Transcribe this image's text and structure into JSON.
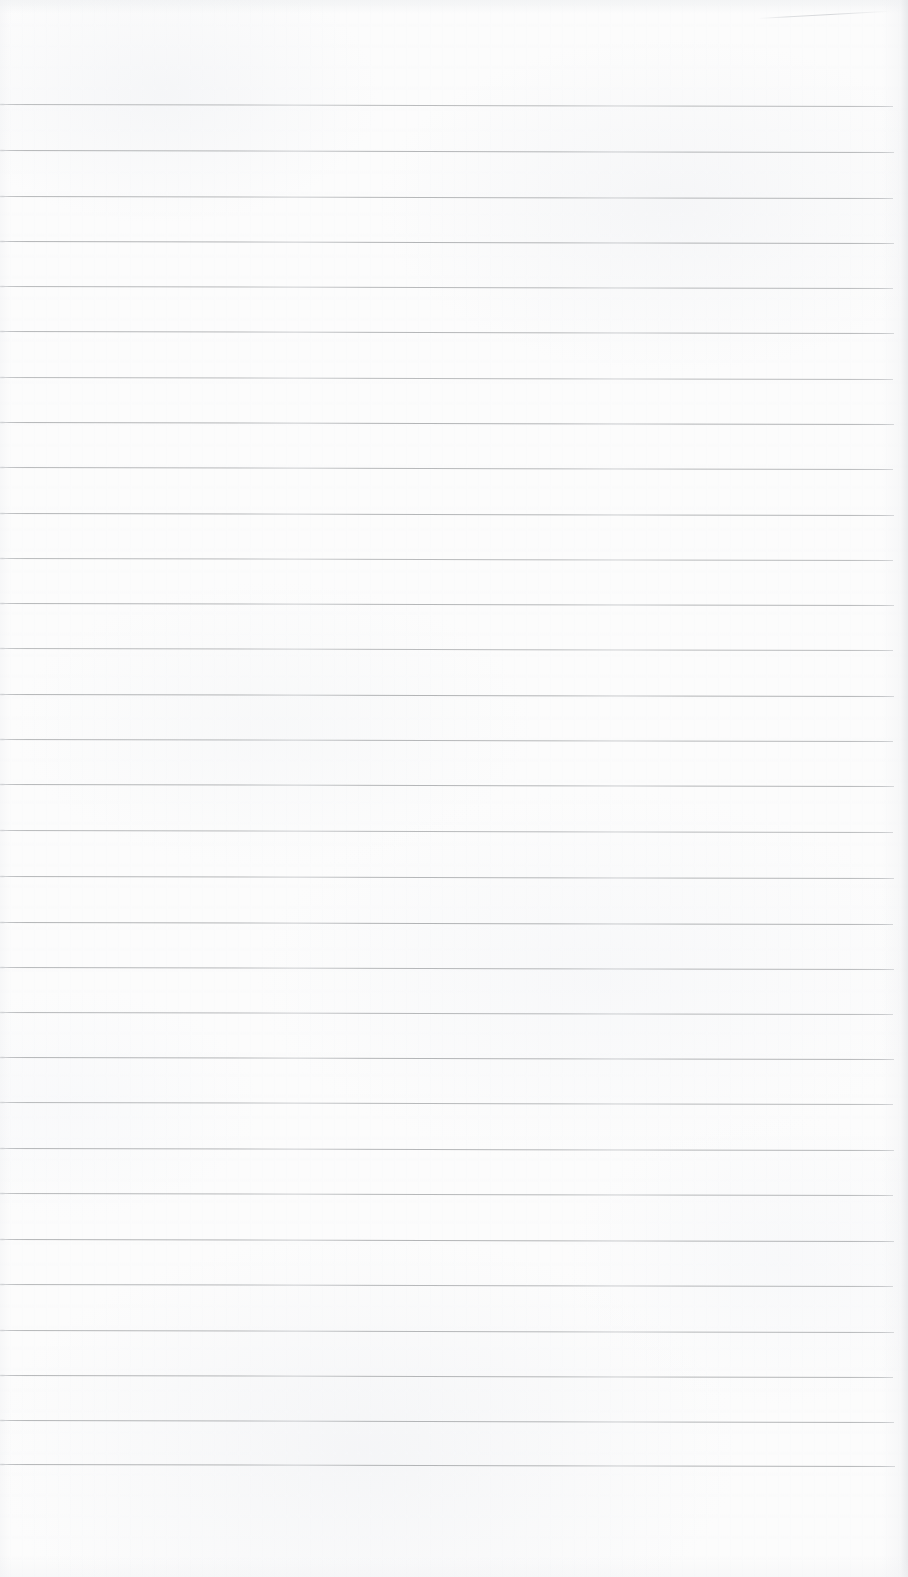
{
  "document": {
    "kind": "scanned-image",
    "subject": "blank ruled notebook paper",
    "width_px": 908,
    "height_px": 1577,
    "text_content": "",
    "handwriting_present": false,
    "printed_text_present": false
  },
  "paper": {
    "background_color": "#fcfcfc",
    "highlight_color": "#ffffff",
    "shadow_color": "#e2e4e7",
    "surface_note": "uneven off-white scan with faint mottling and vertical scanner banding"
  },
  "ruling": {
    "line_color": "#a9abad",
    "line_color_light": "#c3c5c8",
    "line_thickness_px": 1,
    "line_count": 31,
    "first_line_y": 104,
    "spacing_px": 45.3,
    "line_start_x": 0,
    "line_end_x": 894,
    "skew_note": "lines drift ~2px downward from left to right across the page",
    "top_margin_px": 104,
    "bottom_margin_px": 113,
    "lines": [
      {
        "index": 1,
        "y": 104,
        "x1": 0,
        "x2": 893,
        "opacity": 0.8
      },
      {
        "index": 2,
        "y": 150,
        "x1": 0,
        "x2": 894,
        "opacity": 0.86
      },
      {
        "index": 3,
        "y": 196,
        "x1": 0,
        "x2": 893,
        "opacity": 0.84
      },
      {
        "index": 4,
        "y": 241,
        "x1": 0,
        "x2": 894,
        "opacity": 0.88
      },
      {
        "index": 5,
        "y": 286,
        "x1": 0,
        "x2": 893,
        "opacity": 0.82
      },
      {
        "index": 6,
        "y": 331,
        "x1": 0,
        "x2": 894,
        "opacity": 0.85
      },
      {
        "index": 7,
        "y": 377,
        "x1": 0,
        "x2": 893,
        "opacity": 0.8
      },
      {
        "index": 8,
        "y": 422,
        "x1": 0,
        "x2": 894,
        "opacity": 0.87
      },
      {
        "index": 9,
        "y": 467,
        "x1": 0,
        "x2": 893,
        "opacity": 0.83
      },
      {
        "index": 10,
        "y": 513,
        "x1": 0,
        "x2": 894,
        "opacity": 0.86
      },
      {
        "index": 11,
        "y": 558,
        "x1": 0,
        "x2": 893,
        "opacity": 0.81
      },
      {
        "index": 12,
        "y": 603,
        "x1": 0,
        "x2": 894,
        "opacity": 0.85
      },
      {
        "index": 13,
        "y": 648,
        "x1": 0,
        "x2": 893,
        "opacity": 0.8
      },
      {
        "index": 14,
        "y": 694,
        "x1": 0,
        "x2": 894,
        "opacity": 0.88
      },
      {
        "index": 15,
        "y": 739,
        "x1": 0,
        "x2": 893,
        "opacity": 0.84
      },
      {
        "index": 16,
        "y": 784,
        "x1": 0,
        "x2": 894,
        "opacity": 0.86
      },
      {
        "index": 17,
        "y": 830,
        "x1": 0,
        "x2": 893,
        "opacity": 0.82
      },
      {
        "index": 18,
        "y": 876,
        "x1": 0,
        "x2": 894,
        "opacity": 0.85
      },
      {
        "index": 19,
        "y": 922,
        "x1": 0,
        "x2": 893,
        "opacity": 0.89
      },
      {
        "index": 20,
        "y": 967,
        "x1": 0,
        "x2": 894,
        "opacity": 0.84
      },
      {
        "index": 21,
        "y": 1012,
        "x1": 0,
        "x2": 893,
        "opacity": 0.83
      },
      {
        "index": 22,
        "y": 1057,
        "x1": 0,
        "x2": 894,
        "opacity": 0.87
      },
      {
        "index": 23,
        "y": 1102,
        "x1": 0,
        "x2": 893,
        "opacity": 0.82
      },
      {
        "index": 24,
        "y": 1148,
        "x1": 0,
        "x2": 894,
        "opacity": 0.86
      },
      {
        "index": 25,
        "y": 1193,
        "x1": 0,
        "x2": 893,
        "opacity": 0.84
      },
      {
        "index": 26,
        "y": 1239,
        "x1": 0,
        "x2": 894,
        "opacity": 0.88
      },
      {
        "index": 27,
        "y": 1284,
        "x1": 0,
        "x2": 893,
        "opacity": 0.83
      },
      {
        "index": 28,
        "y": 1330,
        "x1": 0,
        "x2": 894,
        "opacity": 0.85
      },
      {
        "index": 29,
        "y": 1375,
        "x1": 0,
        "x2": 893,
        "opacity": 0.86
      },
      {
        "index": 30,
        "y": 1420,
        "x1": 0,
        "x2": 894,
        "opacity": 0.87
      },
      {
        "index": 31,
        "y": 1464,
        "x1": 0,
        "x2": 895,
        "opacity": 0.88
      }
    ]
  },
  "artifacts": {
    "crease": {
      "label": "diagonal crease near top-right corner",
      "x": 758,
      "y": 18,
      "width": 132,
      "angle_deg": -3.2,
      "opacity": 0.55
    },
    "right_edge_shadow": {
      "label": "page edge shading along right margin",
      "width_px": 26
    },
    "bottom_blank_band": {
      "label": "unruled blank band below last line",
      "height_px": 113
    }
  }
}
